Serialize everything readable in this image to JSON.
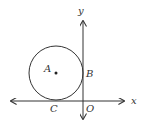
{
  "figure": {
    "type": "geometry-diagram",
    "labels": {
      "center": "A",
      "tangent_y": "B",
      "tangent_x": "C",
      "origin": "O",
      "x_axis": "x",
      "y_axis": "y"
    },
    "colors": {
      "stroke": "#333333",
      "background": "#ffffff"
    }
  }
}
